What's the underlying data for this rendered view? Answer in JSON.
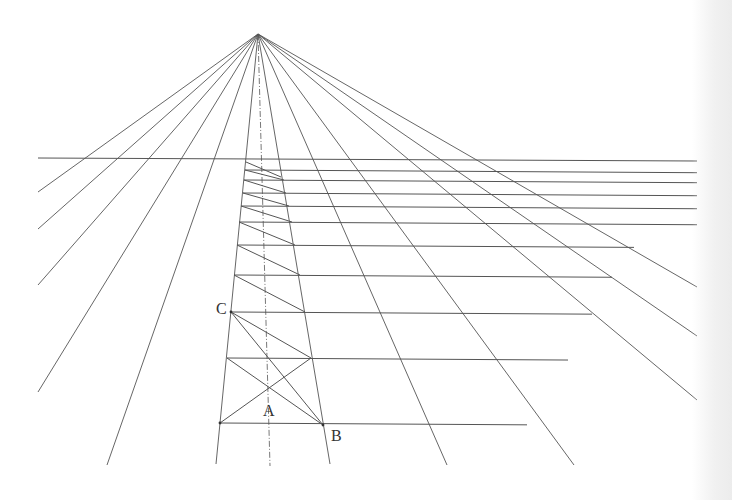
{
  "diagram": {
    "type": "one-point perspective grid construction",
    "vanishing_point": {
      "x": 258,
      "y": 34
    },
    "horizon_line": {
      "y": 158,
      "x1": 38,
      "x2": 697
    },
    "line_color": "#555555",
    "labels": [
      {
        "id": "A",
        "text": "A",
        "x": 263,
        "y": 403
      },
      {
        "id": "B",
        "text": "B",
        "x": 331,
        "y": 428
      },
      {
        "id": "C",
        "text": "C",
        "x": 216,
        "y": 301
      }
    ],
    "left_edge": {
      "top": [
        246,
        158
      ],
      "bottom": [
        216,
        464
      ]
    },
    "right_edge": {
      "top": [
        279,
        158
      ],
      "bottom": [
        330,
        464
      ]
    },
    "center_line": {
      "x_top": 258,
      "y_top": 34,
      "x_bottom": 270,
      "y_bottom": 466,
      "style": "dash-dot"
    },
    "rows": [
      {
        "y": 170,
        "xl": 245,
        "xr": 697
      },
      {
        "y": 180,
        "xl": 244,
        "xr": 697
      },
      {
        "y": 193,
        "xl": 243,
        "xr": 697
      },
      {
        "y": 206,
        "xl": 241,
        "xr": 697
      },
      {
        "y": 222,
        "xl": 239,
        "xr": 697
      },
      {
        "y": 245,
        "xl": 237,
        "xr": 634
      },
      {
        "y": 275,
        "xl": 234,
        "xr": 612
      },
      {
        "y": 312,
        "xl": 231,
        "xr": 592
      },
      {
        "y": 358,
        "xl": 227,
        "xr": 568
      },
      {
        "y": 423,
        "xl": 220,
        "xr": 527
      }
    ],
    "rays": [
      {
        "x2": 38,
        "y2": 192
      },
      {
        "x2": 38,
        "y2": 229
      },
      {
        "x2": 38,
        "y2": 285
      },
      {
        "x2": 38,
        "y2": 392
      },
      {
        "x2": 107,
        "y2": 465
      },
      {
        "x2": 216,
        "y2": 464
      },
      {
        "x2": 330,
        "y2": 464
      },
      {
        "x2": 447,
        "y2": 465
      },
      {
        "x2": 574,
        "y2": 465
      },
      {
        "x2": 697,
        "y2": 400
      },
      {
        "x2": 697,
        "y2": 336
      },
      {
        "x2": 697,
        "y2": 287
      }
    ],
    "diagonals": [
      {
        "x1": 246,
        "y1": 162,
        "x2": 281,
        "y2": 177
      },
      {
        "x2": 284,
        "y2": 180,
        "x1": 245,
        "y1": 170
      },
      {
        "x1": 244,
        "y1": 180,
        "x2": 286,
        "y2": 193
      },
      {
        "x1": 243,
        "y1": 193,
        "x2": 289,
        "y2": 206
      },
      {
        "x1": 241,
        "y1": 206,
        "x2": 292,
        "y2": 222
      },
      {
        "x1": 239,
        "y1": 222,
        "x2": 295,
        "y2": 245
      },
      {
        "x1": 237,
        "y1": 245,
        "x2": 300,
        "y2": 275
      },
      {
        "x1": 234,
        "y1": 275,
        "x2": 305,
        "y2": 312
      },
      {
        "x1": 231,
        "y1": 312,
        "x2": 311,
        "y2": 358
      },
      {
        "x1": 227,
        "y1": 358,
        "x2": 323,
        "y2": 425
      },
      {
        "x1": 231,
        "y1": 312,
        "x2": 323,
        "y2": 425
      },
      {
        "x1": 220,
        "y1": 423,
        "x2": 311,
        "y2": 358
      }
    ]
  }
}
